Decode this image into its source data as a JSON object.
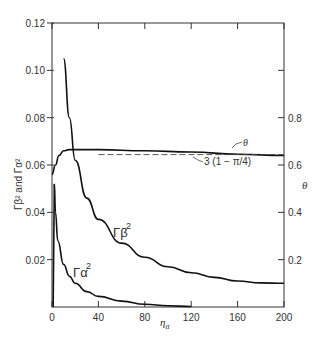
{
  "chart_data": {
    "type": "line",
    "title": "",
    "xlabel": "η_a",
    "ylabel_left": "Γ_β² and Γ_α²",
    "ylabel_right": "θ",
    "xlim": [
      0,
      200
    ],
    "ylim_left": [
      0,
      0.12
    ],
    "ylim_right": [
      0,
      1.2
    ],
    "x_ticks": [
      "0",
      "40",
      "80",
      "120",
      "160",
      "200"
    ],
    "y_ticks_left": [
      "0.02",
      "0.04",
      "0.06",
      "0.08",
      "0.10",
      "0.12"
    ],
    "y_ticks_right": [
      "0.2",
      "0.4",
      "0.6",
      "0.8"
    ],
    "grid": false,
    "series": [
      {
        "name": "Γ_β²",
        "axis": "left",
        "x": [
          10,
          15,
          20,
          30,
          40,
          60,
          80,
          100,
          120,
          140,
          160,
          180,
          200
        ],
        "values": [
          0.105,
          0.08,
          0.062,
          0.046,
          0.037,
          0.027,
          0.021,
          0.017,
          0.0145,
          0.0125,
          0.011,
          0.0102,
          0.01
        ]
      },
      {
        "name": "Γ_α²",
        "axis": "left",
        "x": [
          2,
          3,
          5,
          10,
          15,
          20,
          30,
          40,
          60,
          80,
          100,
          120
        ],
        "values": [
          0.052,
          0.04,
          0.028,
          0.018,
          0.013,
          0.01,
          0.0065,
          0.0045,
          0.0025,
          0.0012,
          0.0005,
          0.0002
        ]
      },
      {
        "name": "θ",
        "axis": "right",
        "x": [
          0,
          3,
          6,
          10,
          15,
          40,
          80,
          120,
          160,
          200
        ],
        "values": [
          0.56,
          0.6,
          0.64,
          0.66,
          0.665,
          0.665,
          0.66,
          0.655,
          0.645,
          0.64
        ]
      },
      {
        "name": "3 (1 − π/4)",
        "axis": "right",
        "style": "dashed",
        "x": [
          40,
          200
        ],
        "values": [
          0.644,
          0.644
        ]
      }
    ],
    "annotations": [
      "θ",
      "3 (1 − π/4)",
      "Γ_β²",
      "Γ_α²"
    ]
  },
  "labels": {
    "theta_curve": "θ",
    "asymptote": "3 (1 − π/4)",
    "gamma_beta": "Γβ",
    "gamma_alpha": "Γα",
    "sq": "2",
    "xlabel_main": "η",
    "xlabel_sub": "a",
    "ylabel": "Γβ² and Γα²",
    "right_label": "θ"
  }
}
